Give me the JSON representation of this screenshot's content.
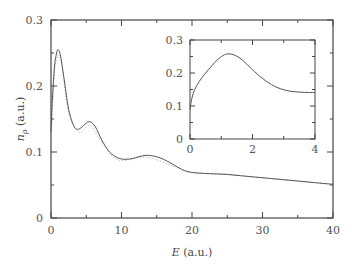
{
  "chart_data": [
    {
      "type": "line",
      "title": "",
      "xlabel": "E (a.u.)",
      "ylabel": "n_ρ (a.u.)",
      "xlim": [
        0,
        40
      ],
      "ylim": [
        0,
        0.3
      ],
      "x_ticks": [
        "0",
        "10",
        "20",
        "30",
        "40"
      ],
      "y_ticks": [
        "0",
        "0.1",
        "0.2",
        "0.3"
      ],
      "grid": false,
      "legend": null,
      "series": [
        {
          "name": "solid",
          "style": "solid",
          "x": [
            0,
            0.2,
            0.5,
            0.8,
            1.0,
            1.3,
            1.8,
            2.5,
            3.3,
            4.0,
            4.8,
            5.5,
            6.3,
            7.2,
            8.3,
            9.5,
            10.5,
            11.5,
            12.5,
            13.5,
            14.5,
            15.5,
            16.5,
            17.5,
            18.5,
            19.5,
            21,
            23,
            25,
            27,
            29,
            31,
            33,
            35,
            37,
            39,
            40
          ],
          "y": [
            0.13,
            0.18,
            0.23,
            0.25,
            0.255,
            0.248,
            0.215,
            0.165,
            0.138,
            0.135,
            0.142,
            0.146,
            0.138,
            0.118,
            0.1,
            0.091,
            0.089,
            0.09,
            0.093,
            0.095,
            0.094,
            0.091,
            0.086,
            0.08,
            0.074,
            0.07,
            0.068,
            0.067,
            0.066,
            0.064,
            0.062,
            0.06,
            0.058,
            0.056,
            0.054,
            0.052,
            0.051
          ]
        },
        {
          "name": "dotted",
          "style": "dotted",
          "x": [
            0,
            0.5,
            1.0,
            1.5,
            2.5,
            4.0,
            5.5,
            7.2,
            9.5,
            13.5,
            17.5,
            20,
            25,
            30,
            35,
            40
          ],
          "y": [
            0.12,
            0.22,
            0.245,
            0.235,
            0.16,
            0.13,
            0.14,
            0.115,
            0.088,
            0.092,
            0.078,
            0.069,
            0.066,
            0.061,
            0.056,
            0.051
          ]
        }
      ]
    },
    {
      "type": "line",
      "title": "inset",
      "xlabel": "",
      "ylabel": "",
      "xlim": [
        0,
        4
      ],
      "ylim": [
        0,
        0.3
      ],
      "x_ticks": [
        "0",
        "2",
        "4"
      ],
      "y_ticks": [
        "0",
        "0.1",
        "0.2",
        "0.3"
      ],
      "grid": false,
      "series": [
        {
          "name": "solid",
          "style": "solid",
          "x": [
            0,
            0.05,
            0.15,
            0.3,
            0.5,
            0.7,
            0.9,
            1.1,
            1.25,
            1.4,
            1.6,
            1.8,
            2.0,
            2.3,
            2.6,
            2.9,
            3.2,
            3.5,
            3.8,
            4.0
          ],
          "y": [
            0.09,
            0.12,
            0.15,
            0.175,
            0.2,
            0.222,
            0.242,
            0.255,
            0.258,
            0.255,
            0.245,
            0.228,
            0.21,
            0.185,
            0.165,
            0.152,
            0.145,
            0.142,
            0.141,
            0.141
          ]
        }
      ]
    }
  ],
  "labels": {
    "xlabel_main": "E",
    "xlabel_unit": " (a.u.)",
    "ylabel_main": "n",
    "ylabel_sub": "ρ",
    "ylabel_unit": " (a.u.)"
  }
}
